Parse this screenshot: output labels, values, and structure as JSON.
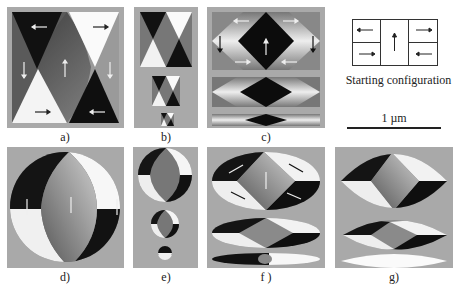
{
  "figure": {
    "panels": [
      {
        "id": "a",
        "label": "a)"
      },
      {
        "id": "b",
        "label": "b)"
      },
      {
        "id": "c",
        "label": "c)"
      },
      {
        "id": "d",
        "label": "d)"
      },
      {
        "id": "e",
        "label": "e)"
      },
      {
        "id": "f",
        "label": "f )"
      },
      {
        "id": "g",
        "label": "g)"
      }
    ],
    "starting_configuration": {
      "caption": "Starting configuration",
      "cells": [
        {
          "position": "top-left",
          "arrow": "left"
        },
        {
          "position": "bottom-left",
          "arrow": "right"
        },
        {
          "position": "center",
          "arrow": "up"
        },
        {
          "position": "top-right",
          "arrow": "right"
        },
        {
          "position": "bottom-right",
          "arrow": "left"
        }
      ]
    },
    "scale_bar": {
      "label": "1 µm"
    }
  }
}
